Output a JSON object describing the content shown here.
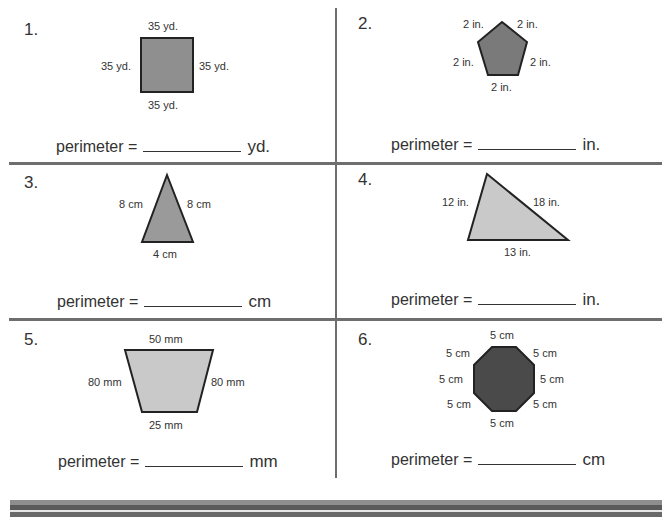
{
  "worksheet": {
    "perimeter_label": "perimeter =",
    "problems": [
      {
        "number": "1.",
        "shape": "square",
        "fill": "#8f8f8f",
        "sides": {
          "top": "35 yd.",
          "left": "35 yd.",
          "right": "35 yd.",
          "bottom": "35 yd."
        },
        "unit": "yd."
      },
      {
        "number": "2.",
        "shape": "pentagon",
        "fill": "#7a7a7a",
        "sides": {
          "top_left": "2 in.",
          "top_right": "2 in.",
          "left": "2 in.",
          "right": "2 in.",
          "bottom": "2 in."
        },
        "unit": "in."
      },
      {
        "number": "3.",
        "shape": "isosceles-triangle",
        "fill": "#9a9a9a",
        "sides": {
          "left": "8 cm",
          "right": "8 cm",
          "bottom": "4 cm"
        },
        "unit": "cm"
      },
      {
        "number": "4.",
        "shape": "scalene-triangle",
        "fill": "#c9c9c9",
        "sides": {
          "left": "12 in.",
          "right": "18 in.",
          "bottom": "13 in."
        },
        "unit": "in."
      },
      {
        "number": "5.",
        "shape": "trapezoid",
        "fill": "#c9c9c9",
        "sides": {
          "top": "50 mm",
          "left": "80 mm",
          "right": "80 mm",
          "bottom": "25 mm"
        },
        "unit": "mm"
      },
      {
        "number": "6.",
        "shape": "octagon",
        "fill": "#4a4a4a",
        "sides": {
          "top": "5 cm",
          "top_left": "5 cm",
          "top_right": "5 cm",
          "left": "5 cm",
          "right": "5 cm",
          "bottom_left": "5 cm",
          "bottom_right": "5 cm",
          "bottom": "5 cm"
        },
        "unit": "cm"
      }
    ]
  }
}
